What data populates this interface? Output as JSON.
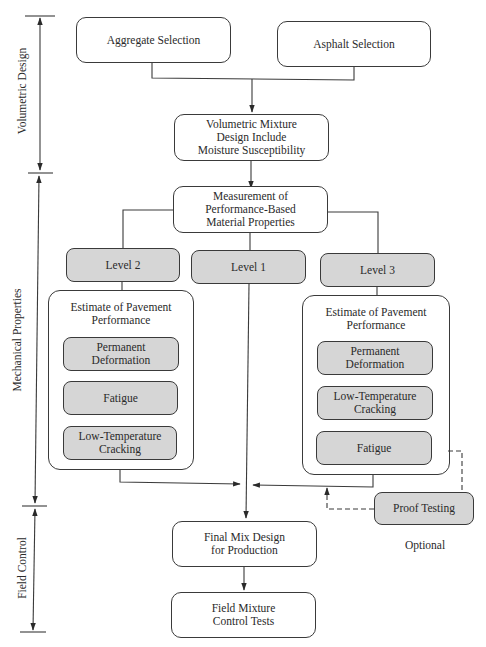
{
  "diagram": {
    "phases": [
      {
        "label": "Volumetric Design"
      },
      {
        "label": "Mechanical Properties"
      },
      {
        "label": "Field Control"
      }
    ],
    "nodes": {
      "aggregate": "Aggregate Selection",
      "asphalt": "Asphalt Selection",
      "volumetric": "Volumetric Mixture Design Include Moisture Susceptibility",
      "volumetric_lines": [
        "Volumetric Mixture",
        "Design Include",
        "Moisture Susceptibility"
      ],
      "measurement_lines": [
        "Measurement of",
        "Performance-Based",
        "Material Properties"
      ],
      "level2": "Level 2",
      "level1": "Level 1",
      "level3": "Level 3",
      "left_group": {
        "title_lines": [
          "Estimate of Pavement",
          "Performance"
        ],
        "items": [
          {
            "lines": [
              "Permanent",
              "Deformation"
            ]
          },
          {
            "lines": [
              "Fatigue"
            ]
          },
          {
            "lines": [
              "Low-Temperature",
              "Cracking"
            ]
          }
        ]
      },
      "right_group": {
        "title_lines": [
          "Estimate of Pavement",
          "Performance"
        ],
        "items": [
          {
            "lines": [
              "Permanent",
              "Deformation"
            ]
          },
          {
            "lines": [
              "Low-Temperature",
              "Cracking"
            ]
          },
          {
            "lines": [
              "Fatigue"
            ]
          }
        ]
      },
      "proof_testing": "Proof Testing",
      "optional": "Optional",
      "final_mix_lines": [
        "Final Mix Design",
        "for Production"
      ],
      "field_tests_lines": [
        "Field Mixture",
        "Control Tests"
      ]
    },
    "colors": {
      "line": "#3a3a3a",
      "gray_fill": "#d6d6d6",
      "background": "#ffffff"
    }
  }
}
